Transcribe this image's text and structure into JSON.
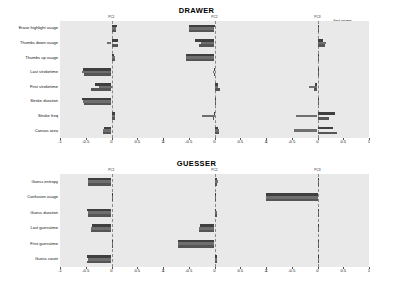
{
  "figure": {
    "background": "#ffffff",
    "panel_background": "#e9e9e9"
  },
  "legend": {
    "position": "top-right",
    "entries": [
      {
        "label": "first game",
        "color": "#3f3f3f"
      },
      {
        "label": "all but first game",
        "color": "#6f6f6f"
      },
      {
        "label": "all",
        "color": "#555555"
      }
    ]
  },
  "axis": {
    "ticks": [
      "-1",
      "-0.5",
      "0",
      "0.5",
      "1"
    ],
    "tick_values": [
      -1,
      -0.5,
      0,
      0.5,
      1
    ],
    "xlim": [
      -1,
      1
    ]
  },
  "chart_data": [
    {
      "type": "bar",
      "orientation": "horizontal",
      "title": "DRAWER",
      "panel": "PC1",
      "xlabel": "",
      "ylabel": "",
      "xlim": [
        -1,
        1
      ],
      "grid": false,
      "legend": [
        "first game",
        "all but first game",
        "all"
      ],
      "categories": [
        "Erase highlight usage",
        "Thumbs down usage",
        "Thumbs up usage",
        "Last stroketime",
        "First stroketime",
        "Stroke duration",
        "Stroke freq",
        "Canvas area"
      ],
      "series": [
        {
          "name": "first game",
          "values": [
            0.1,
            0.13,
            0.05,
            -0.56,
            -0.33,
            -0.57,
            0.06,
            -0.15
          ]
        },
        {
          "name": "all but first game",
          "values": [
            0.09,
            -0.09,
            0.06,
            -0.57,
            -0.25,
            -0.55,
            0.07,
            -0.17
          ]
        },
        {
          "name": "all",
          "values": [
            0.09,
            0.12,
            0.06,
            -0.53,
            -0.4,
            -0.53,
            0.06,
            -0.16
          ]
        }
      ]
    },
    {
      "type": "bar",
      "orientation": "horizontal",
      "title": "DRAWER",
      "panel": "PC2",
      "xlabel": "",
      "ylabel": "",
      "xlim": [
        -1,
        1
      ],
      "grid": false,
      "legend": [
        "first game",
        "all but first game",
        "all"
      ],
      "categories": [
        "Erase highlight usage",
        "Thumbs down usage",
        "Thumbs up usage",
        "Last stroketime",
        "First stroketime",
        "Stroke duration",
        "Stroke freq",
        "Canvas area"
      ],
      "series": [
        {
          "name": "first game",
          "values": [
            -0.5,
            -0.38,
            -0.56,
            -0.01,
            0.07,
            0.0,
            -0.01,
            0.07
          ]
        },
        {
          "name": "all but first game",
          "values": [
            -0.49,
            -0.27,
            -0.56,
            -0.02,
            0.06,
            0.01,
            -0.25,
            0.09
          ]
        },
        {
          "name": "all",
          "values": [
            -0.49,
            -0.3,
            -0.55,
            -0.01,
            0.1,
            0.0,
            -0.03,
            0.08
          ]
        }
      ]
    },
    {
      "type": "bar",
      "orientation": "horizontal",
      "title": "DRAWER",
      "panel": "PC3",
      "xlabel": "",
      "ylabel": "",
      "xlim": [
        -1,
        1
      ],
      "grid": false,
      "legend": [
        "first game",
        "all but first game",
        "all"
      ],
      "categories": [
        "Erase highlight usage",
        "Thumbs down usage",
        "Thumbs up usage",
        "Last stroketime",
        "First stroketime",
        "Stroke duration",
        "Stroke freq",
        "Canvas area"
      ],
      "series": [
        {
          "name": "first game",
          "values": [
            0.02,
            0.1,
            0.01,
            0.02,
            -0.04,
            0.02,
            0.34,
            0.31
          ]
        },
        {
          "name": "all but first game",
          "values": [
            0.02,
            0.17,
            0.02,
            0.02,
            -0.17,
            0.02,
            -0.41,
            -0.46
          ]
        },
        {
          "name": "all",
          "values": [
            0.02,
            0.14,
            0.01,
            0.02,
            -0.06,
            0.02,
            0.22,
            0.37
          ]
        }
      ]
    },
    {
      "type": "bar",
      "orientation": "horizontal",
      "title": "GUESSER",
      "panel": "PC1",
      "xlabel": "",
      "ylabel": "",
      "xlim": [
        -1,
        1
      ],
      "grid": false,
      "legend": [
        "first game",
        "all but first game",
        "all"
      ],
      "categories": [
        "Guess entropy",
        "Confusion usage",
        "Guess duration",
        "Last guesstime",
        "First guesstime",
        "Guess count"
      ],
      "series": [
        {
          "name": "first game",
          "values": [
            -0.46,
            0.0,
            -0.47,
            -0.37,
            0.03,
            -0.47
          ]
        },
        {
          "name": "all but first game",
          "values": [
            -0.46,
            0.0,
            -0.46,
            -0.4,
            0.02,
            -0.46
          ]
        },
        {
          "name": "all",
          "values": [
            -0.46,
            0.0,
            -0.46,
            -0.4,
            0.03,
            -0.47
          ]
        }
      ]
    },
    {
      "type": "bar",
      "orientation": "horizontal",
      "title": "GUESSER",
      "panel": "PC2",
      "xlabel": "",
      "ylabel": "",
      "xlim": [
        -1,
        1
      ],
      "grid": false,
      "legend": [
        "first game",
        "all but first game",
        "all"
      ],
      "categories": [
        "Guess entropy",
        "Confusion usage",
        "Guess duration",
        "Last guesstime",
        "First guesstime",
        "Guess count"
      ],
      "series": [
        {
          "name": "first game",
          "values": [
            0.04,
            0.0,
            0.03,
            -0.28,
            -0.71,
            0.05
          ]
        },
        {
          "name": "all but first game",
          "values": [
            0.06,
            0.0,
            0.05,
            -0.3,
            -0.7,
            0.04
          ]
        },
        {
          "name": "all",
          "values": [
            0.05,
            0.0,
            0.04,
            -0.3,
            -0.71,
            0.05
          ]
        }
      ]
    },
    {
      "type": "bar",
      "orientation": "horizontal",
      "title": "GUESSER",
      "panel": "PC3",
      "xlabel": "",
      "ylabel": "",
      "xlim": [
        -1,
        1
      ],
      "grid": false,
      "legend": [
        "first game",
        "all but first game",
        "all"
      ],
      "categories": [
        "Guess entropy",
        "Confusion usage",
        "Guess duration",
        "Last guesstime",
        "First guesstime",
        "Guess count"
      ],
      "series": [
        {
          "name": "first game",
          "values": [
            0.01,
            -1.0,
            0.01,
            0.01,
            0.01,
            0.01
          ]
        },
        {
          "name": "all but first game",
          "values": [
            0.01,
            -1.0,
            0.01,
            0.01,
            0.01,
            0.01
          ]
        },
        {
          "name": "all",
          "values": [
            0.01,
            -1.0,
            0.01,
            0.01,
            0.01,
            0.01
          ]
        }
      ]
    }
  ]
}
